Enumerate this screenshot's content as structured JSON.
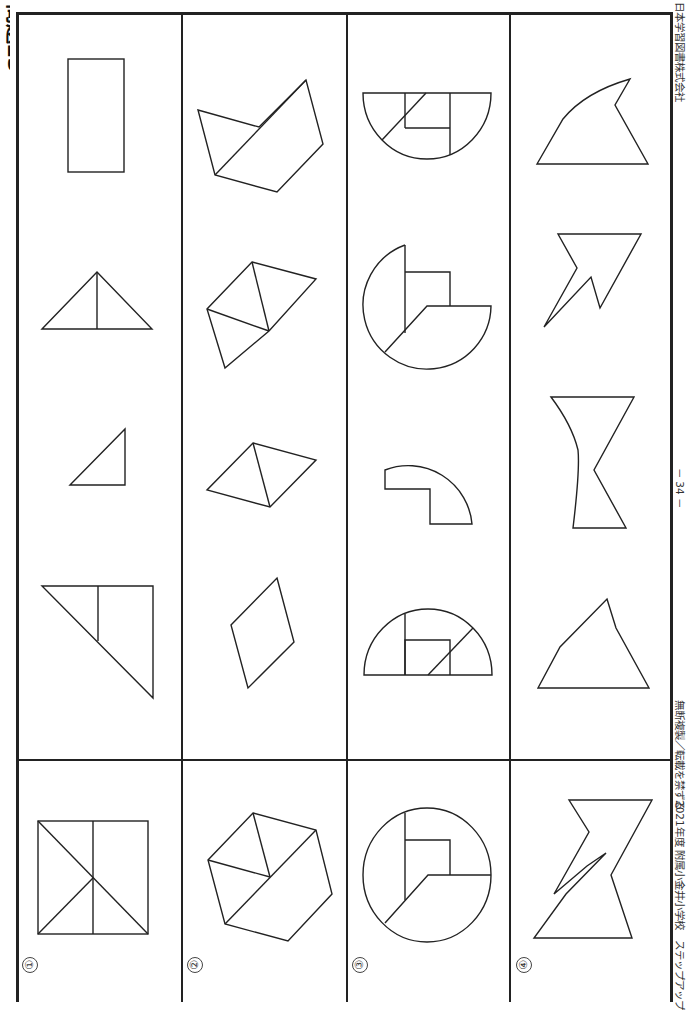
{
  "title": "問題23",
  "rows": [
    {
      "number": "①",
      "label": "row-1",
      "choices": [
        "rectangle",
        "triangle-split-vertical",
        "right-triangle",
        "trapezoid-with-diagonal"
      ],
      "reference": "rectangle-with-hourglass-triangles"
    },
    {
      "number": "②",
      "label": "row-2",
      "choices": [
        "pentagon-with-diagonal",
        "quad-with-triangles",
        "rhombus-with-diagonal",
        "rhombus"
      ],
      "reference": "hexagon-composite"
    },
    {
      "number": "③",
      "label": "row-3",
      "choices": [
        "semicircle-composite",
        "circle-sector-composite",
        "quarter-ring-piece",
        "semicircle-composite-2"
      ],
      "reference": "circle-composite"
    },
    {
      "number": "④",
      "label": "row-4",
      "choices": [
        "curved-fin",
        "arrow-zigzag",
        "curved-hourglass",
        "quadrilateral"
      ],
      "reference": "zigzag-hourglass"
    }
  ],
  "footer": {
    "publisher": "日本学習図書株式会社",
    "page": "－ 34 －",
    "notice": "無断複製／転載を禁ずる",
    "series": "2021年度 附属小金井小学校　ステップアップ"
  },
  "colors": {
    "line": "#222222",
    "background": "#ffffff"
  }
}
